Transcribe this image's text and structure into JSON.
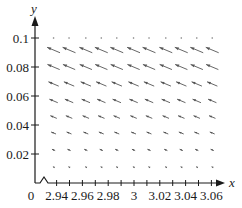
{
  "chart_data": {
    "type": "vector_field",
    "title": "",
    "xlabel": "x",
    "ylabel": "y",
    "xlim": [
      2.925,
      3.07
    ],
    "ylim": [
      0,
      0.105
    ],
    "axis_break_x": true,
    "x_ticks": [
      2.94,
      2.96,
      2.98,
      3,
      3.02,
      3.04,
      3.06
    ],
    "x_tick_labels": [
      "2.94",
      "2.96",
      "2.98",
      "3",
      "3.02",
      "3.04",
      "3.06"
    ],
    "x_minor_step": 0.01,
    "y_ticks": [
      0.02,
      0.04,
      0.06,
      0.08,
      0.1
    ],
    "y_tick_labels": [
      "0.02",
      "0.04",
      "0.06",
      "0.08",
      "0.1"
    ],
    "origin_label": "0",
    "grid": false,
    "field": {
      "x": [
        2.933,
        2.945,
        2.958,
        2.97,
        2.982,
        2.995,
        3.007,
        3.02,
        3.032,
        3.044,
        3.056
      ],
      "y": [
        0.1,
        0.0917,
        0.08,
        0.0683,
        0.0566,
        0.0455,
        0.0345,
        0.0228,
        0.011
      ],
      "direction": "up-left",
      "slope_dy_dx": -0.45,
      "relative_magnitude_by_row": [
        0.0,
        1.0,
        0.95,
        0.8,
        0.65,
        0.5,
        0.38,
        0.25,
        0.1
      ]
    }
  },
  "colors": {
    "axis": "#1a1a1a",
    "arrow": "#555555"
  }
}
